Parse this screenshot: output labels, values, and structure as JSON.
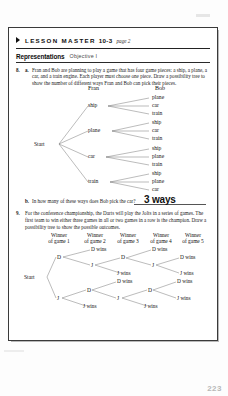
{
  "worksheet": {
    "header": {
      "marker_icon": "right-triangle-bullet-icon",
      "title": "LESSON MASTER",
      "number": "10-3",
      "page_label": "page 2"
    },
    "section": {
      "name": "Representations",
      "objective": "Objective I"
    },
    "problems": [
      {
        "number": "8.",
        "letter": "a.",
        "text": "Fran and Bob are planning to play a game that has four game pieces: a ship, a plane, a car, and a train engine. Each player must choose one piece. Draw a possibility tree to show the number of different ways Fran and Bob can pick their pieces."
      },
      {
        "number": "",
        "letter": "b.",
        "text": "In how many of these ways does Bob pick the car?",
        "answer": "3 ways"
      },
      {
        "number": "9.",
        "letter": "",
        "text": "For the conference championship, the Darts will play the Jolts in a series of games. The first team to win either three games in all or two games in a row is the champion. Draw a possibility tree to show the possible outcomes."
      }
    ],
    "tree1": {
      "root": "Start",
      "column_headers": [
        "Fran",
        "Bob"
      ],
      "branches": [
        {
          "fran": "ship",
          "bob": [
            "plane",
            "car",
            "train"
          ]
        },
        {
          "fran": "plane",
          "bob": [
            "ship",
            "car",
            "train"
          ]
        },
        {
          "fran": "car",
          "bob": [
            "ship",
            "plane",
            "train"
          ]
        },
        {
          "fran": "train",
          "bob": [
            "ship",
            "plane",
            "car"
          ]
        }
      ]
    },
    "tree2": {
      "root": "Start",
      "column_headers": [
        "Winner of game 1",
        "Winner of game 2",
        "Winner of game 3",
        "Winner of game 4",
        "Winner of game 5"
      ],
      "header_lines": [
        [
          "Winner",
          "of game 1"
        ],
        [
          "Winner",
          "of game 2"
        ],
        [
          "Winner",
          "of game 3"
        ],
        [
          "Winner",
          "of game 4"
        ],
        [
          "Winner",
          "of game 5"
        ]
      ],
      "nodes": {
        "g1_d": "D",
        "g1_j": "J",
        "top_g2_d_wins": "D wins",
        "top_g2_j": "J",
        "top_g3_d": "D",
        "top_g3_j_wins": "J wins",
        "top_g4_d_wins": "D wins",
        "top_g4_j": "J",
        "top_g5_d_wins": "D wins",
        "top_g5_j_wins": "J wins",
        "bot_g2_d": "D",
        "bot_g2_j_wins": "J wins",
        "bot_g3_d_wins": "D wins",
        "bot_g3_j": "J",
        "bot_g4_d": "D",
        "bot_g4_j_wins": "J wins",
        "bot_g5_d_wins": "D wins",
        "bot_g5_j_wins": "J wins"
      }
    },
    "footer": {
      "page_number": "223"
    }
  }
}
